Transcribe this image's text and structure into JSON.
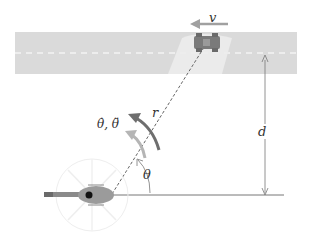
{
  "diagram": {
    "labels": {
      "velocity": "v",
      "range": "r",
      "angular_rates": "θ̇, θ̈",
      "angle": "θ",
      "distance": "d"
    },
    "elements": {
      "road": {
        "color": "#d9d9d9",
        "centerline": "dashed white"
      },
      "car": {
        "color": "#7a7a7a",
        "heading": "left"
      },
      "helicopter": {
        "body_color": "#9a9a9a",
        "tail_color": "#888888",
        "dot_color": "#111111"
      },
      "velocity_arrow_color": "#a0a0a0",
      "rate_arrow_dark": "#6e6e6e",
      "rate_arrow_light": "#b5b5b5",
      "line_color": "#777777"
    }
  }
}
